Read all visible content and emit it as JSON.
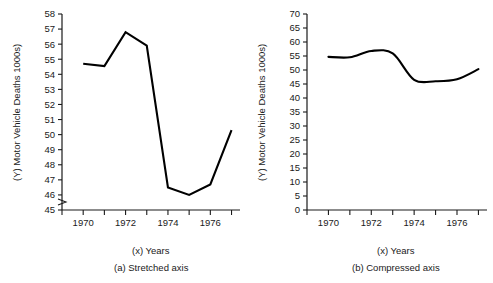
{
  "chart_data": [
    {
      "id": "stretched",
      "type": "line",
      "title": "",
      "caption": "(a) Stretched axis",
      "xlabel": "(x) Years",
      "ylabel": "(Y) Motor Vehicle Deaths 1000s)",
      "x": [
        1970,
        1971,
        1972,
        1973,
        1974,
        1975,
        1976,
        1977
      ],
      "values": [
        54.7,
        54.55,
        56.8,
        55.9,
        46.5,
        46.0,
        46.7,
        50.3
      ],
      "series": [
        {
          "name": "Motor Vehicle Deaths",
          "values": [
            54.7,
            54.55,
            56.8,
            55.9,
            46.5,
            46.0,
            46.7,
            50.3
          ]
        }
      ],
      "ylim": [
        45,
        58
      ],
      "ytick_step": 1,
      "yticks": [
        45,
        46,
        47,
        48,
        49,
        50,
        51,
        52,
        53,
        54,
        55,
        56,
        57,
        58
      ],
      "xlim": [
        1969,
        1977.4
      ],
      "xticks": [
        1969,
        1970,
        1971,
        1972,
        1973,
        1974,
        1975,
        1976,
        1977
      ],
      "xtick_labels": [
        "",
        "1970",
        "",
        "1972",
        "",
        "1974",
        "",
        "1976",
        ""
      ],
      "grid": false,
      "legend": "none",
      "axis_break": true,
      "interpolation": "linear",
      "line_color": "#000000"
    },
    {
      "id": "compressed",
      "type": "line",
      "title": "",
      "caption": "(b) Compressed axis",
      "xlabel": "(x) Years",
      "ylabel": "(Y) Motor Vehicle Deaths 1000s)",
      "x": [
        1970,
        1971,
        1972,
        1973,
        1974,
        1975,
        1976,
        1977
      ],
      "values": [
        54.7,
        54.55,
        56.8,
        55.9,
        46.5,
        46.0,
        46.7,
        50.3
      ],
      "series": [
        {
          "name": "Motor Vehicle Deaths",
          "values": [
            54.7,
            54.55,
            56.8,
            55.9,
            46.5,
            46.0,
            46.7,
            50.3
          ]
        }
      ],
      "ylim": [
        0,
        70
      ],
      "ytick_step": 5,
      "yticks": [
        0,
        5,
        10,
        15,
        20,
        25,
        30,
        35,
        40,
        45,
        50,
        55,
        60,
        65,
        70
      ],
      "xlim": [
        1969,
        1977.4
      ],
      "xticks": [
        1969,
        1970,
        1971,
        1972,
        1973,
        1974,
        1975,
        1976,
        1977
      ],
      "xtick_labels": [
        "",
        "1970",
        "",
        "1972",
        "",
        "1974",
        "",
        "1976",
        ""
      ],
      "grid": false,
      "legend": "none",
      "axis_break": false,
      "interpolation": "smooth",
      "line_color": "#000000"
    }
  ]
}
